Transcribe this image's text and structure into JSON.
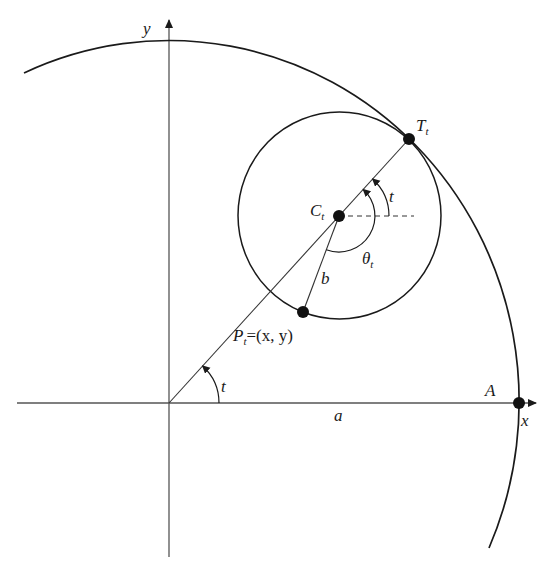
{
  "figure": {
    "type": "geometric-diagram",
    "colors": {
      "stroke": "#1a1a1a",
      "background": "#ffffff",
      "dashed": "#333333"
    }
  },
  "axes": {
    "x_label": "x",
    "y_label": "y",
    "origin": [
      169,
      403
    ]
  },
  "labels": {
    "T": "T",
    "T_sub": "t",
    "C": "C",
    "C_sub": "t",
    "P": "P",
    "P_sub": "t",
    "P_eq": "=(x, y)",
    "theta": "θ",
    "theta_sub": "t",
    "b": "b",
    "a": "a",
    "A": "A",
    "t_center": "t",
    "t_origin": "t"
  },
  "points": [
    {
      "name": "T_t",
      "xy": [
        409,
        139
      ]
    },
    {
      "name": "C_t",
      "xy": [
        339,
        216
      ]
    },
    {
      "name": "P_t",
      "xy": [
        303,
        312
      ]
    },
    {
      "name": "A",
      "xy": [
        519,
        403
      ]
    }
  ],
  "curves": {
    "outer": {
      "center": [
        169,
        403
      ],
      "rx": 350,
      "ry": 361
    },
    "rolling_circle": {
      "center": [
        339.5,
        215.5
      ],
      "rx": 101.5,
      "ry": 103.5
    }
  }
}
